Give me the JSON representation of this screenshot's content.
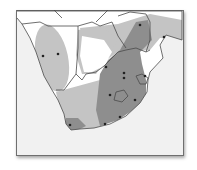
{
  "map": {
    "type": "species-range-map",
    "region": "southern Africa",
    "colors": {
      "background": "#f1f1f1",
      "land": "#ffffff",
      "range_light": "#c4c4c4",
      "range_dark": "#8e8e8e",
      "border": "#4a4a4a",
      "marker": "#222222",
      "frame": "#6f6f6f"
    },
    "markers": [
      {
        "x": 43,
        "y": 56
      },
      {
        "x": 58,
        "y": 54
      },
      {
        "x": 106,
        "y": 67
      },
      {
        "x": 140,
        "y": 25
      },
      {
        "x": 164,
        "y": 37
      },
      {
        "x": 124,
        "y": 73
      },
      {
        "x": 124,
        "y": 78
      },
      {
        "x": 145,
        "y": 76
      },
      {
        "x": 110,
        "y": 95
      },
      {
        "x": 135,
        "y": 100
      },
      {
        "x": 120,
        "y": 117
      },
      {
        "x": 105,
        "y": 124
      },
      {
        "x": 70,
        "y": 125
      }
    ]
  }
}
